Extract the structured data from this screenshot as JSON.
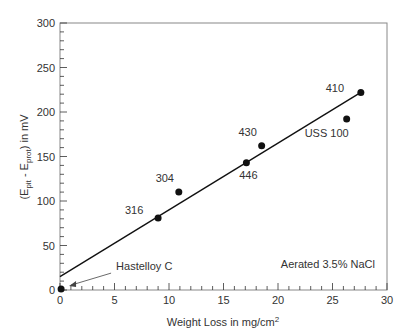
{
  "chart_data": {
    "type": "scatter",
    "title": "",
    "xlabel": "Weight Loss in mg/cm",
    "xlabel_sup": "2",
    "ylabel_parts": [
      "(E",
      "pit",
      " - E",
      "prot",
      ") in mV"
    ],
    "xlim": [
      0,
      30
    ],
    "ylim": [
      0,
      300
    ],
    "x_ticks": [
      0,
      5,
      10,
      15,
      20,
      25,
      30
    ],
    "y_ticks": [
      0,
      50,
      100,
      150,
      200,
      250,
      300
    ],
    "x_minor_step": 1,
    "y_minor_step": 10,
    "grid": false,
    "points": [
      {
        "label": "Hastelloy C",
        "x": 0.1,
        "y": 1,
        "label_dx": 22,
        "label_dy": -14,
        "arrow": true
      },
      {
        "label": "316",
        "x": 9.0,
        "y": 81,
        "label_dx": -24,
        "label_dy": -4
      },
      {
        "label": "304",
        "x": 10.9,
        "y": 110,
        "label_dx": -14,
        "label_dy": -10
      },
      {
        "label": "446",
        "x": 17.1,
        "y": 143,
        "label_dx": 2,
        "label_dy": 16
      },
      {
        "label": "430",
        "x": 18.5,
        "y": 162,
        "label_dx": -14,
        "label_dy": -10
      },
      {
        "label": "USS 100",
        "x": 26.3,
        "y": 192,
        "label_dx": -20,
        "label_dy": 18
      },
      {
        "label": "410",
        "x": 27.6,
        "y": 222,
        "label_dx": -26,
        "label_dy": 0
      }
    ],
    "fit_line": {
      "x": [
        0,
        27.6
      ],
      "y": [
        15,
        222
      ]
    },
    "annotation": "Aerated 3.5% NaCl"
  }
}
